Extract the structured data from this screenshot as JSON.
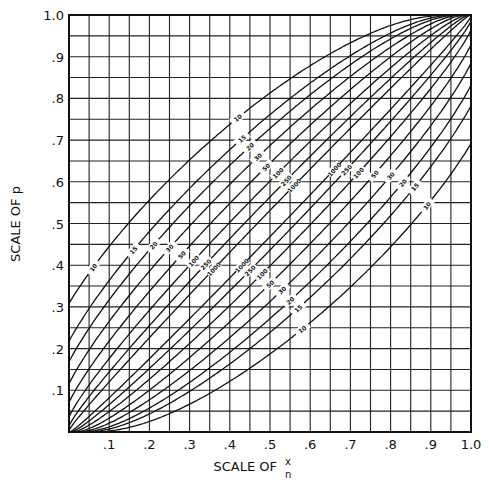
{
  "chart_data": {
    "type": "line",
    "title": "",
    "xlabel": "SCALE OF x/n",
    "xlabel_prefix": "SCALE OF",
    "xlabel_num": "x",
    "xlabel_den": "n",
    "ylabel": "SCALE OF p",
    "xlim": [
      0,
      1.0
    ],
    "ylim": [
      0,
      1.0
    ],
    "grid": true,
    "grid_step": 0.05,
    "confidence_level": 0.95,
    "x_ticks": [
      ".1",
      ".2",
      ".3",
      ".4",
      ".5",
      ".6",
      ".7",
      ".8",
      ".9",
      "1.0"
    ],
    "x_tick_values": [
      0.1,
      0.2,
      0.3,
      0.4,
      0.5,
      0.6,
      0.7,
      0.8,
      0.9,
      1.0
    ],
    "y_ticks": [
      ".1",
      ".2",
      ".3",
      ".4",
      ".5",
      ".6",
      ".7",
      ".8",
      ".9",
      "1.0"
    ],
    "y_tick_values": [
      0.1,
      0.2,
      0.3,
      0.4,
      0.5,
      0.6,
      0.7,
      0.8,
      0.9,
      1.0
    ],
    "series": [
      {
        "name": "upper n=10",
        "n": 10,
        "bound": "upper",
        "label": "10"
      },
      {
        "name": "upper n=15",
        "n": 15,
        "bound": "upper",
        "label": "15"
      },
      {
        "name": "upper n=20",
        "n": 20,
        "bound": "upper",
        "label": "20"
      },
      {
        "name": "upper n=30",
        "n": 30,
        "bound": "upper",
        "label": "30"
      },
      {
        "name": "upper n=50",
        "n": 50,
        "bound": "upper",
        "label": "50"
      },
      {
        "name": "upper n=100",
        "n": 100,
        "bound": "upper",
        "label": "100"
      },
      {
        "name": "upper n=250",
        "n": 250,
        "bound": "upper",
        "label": "250"
      },
      {
        "name": "upper n=1000",
        "n": 1000,
        "bound": "upper",
        "label": "1000"
      },
      {
        "name": "lower n=1000",
        "n": 1000,
        "bound": "lower",
        "label": "1000"
      },
      {
        "name": "lower n=250",
        "n": 250,
        "bound": "lower",
        "label": "250"
      },
      {
        "name": "lower n=100",
        "n": 100,
        "bound": "lower",
        "label": "100"
      },
      {
        "name": "lower n=50",
        "n": 50,
        "bound": "lower",
        "label": "50"
      },
      {
        "name": "lower n=30",
        "n": 30,
        "bound": "lower",
        "label": "30"
      },
      {
        "name": "lower n=20",
        "n": 20,
        "bound": "lower",
        "label": "20"
      },
      {
        "name": "lower n=15",
        "n": 15,
        "bound": "lower",
        "label": "15"
      },
      {
        "name": "lower n=10",
        "n": 10,
        "bound": "lower",
        "label": "10"
      }
    ],
    "sample_points": {
      "upper n=10": {
        "x": [
          0,
          0.1,
          0.3,
          0.5,
          0.7,
          1.0
        ],
        "p": [
          0.31,
          0.45,
          0.65,
          0.81,
          0.93,
          1.0
        ]
      },
      "lower n=10": {
        "x": [
          0,
          0.3,
          0.5,
          0.7,
          0.9,
          1.0
        ],
        "p": [
          0.0,
          0.07,
          0.19,
          0.35,
          0.55,
          0.69
        ]
      },
      "upper n=1000": {
        "x": [
          0,
          0.5,
          1.0
        ],
        "p": [
          0.004,
          0.53,
          1.0
        ]
      },
      "lower n=1000": {
        "x": [
          0,
          0.5,
          1.0
        ],
        "p": [
          0.0,
          0.47,
          0.996
        ]
      }
    }
  }
}
